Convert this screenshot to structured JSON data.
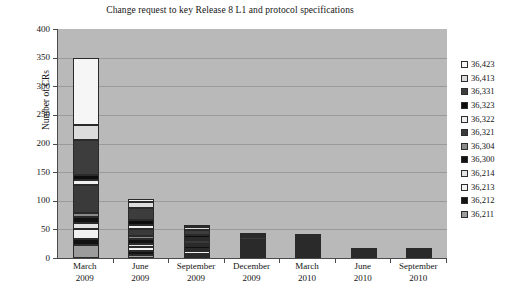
{
  "chart_data": {
    "type": "bar",
    "subtype": "stacked-bar",
    "title": "Change request to key Release 8  L1 and protocol specifications",
    "xlabel": "",
    "ylabel": "Number of CRs",
    "ylim": [
      0,
      400
    ],
    "ytick_step": 50,
    "ytick_labels": [
      "400",
      "350",
      "300",
      "250",
      "200",
      "150",
      "100",
      "50",
      "0"
    ],
    "grid": true,
    "legend_position": "right",
    "categories": [
      "March\n2009",
      "June\n2009",
      "September\n2009",
      "December\n2009",
      "March\n2010",
      "June\n2010",
      "September\n2010"
    ],
    "category_lines": [
      [
        "March",
        "2009"
      ],
      [
        "June",
        "2009"
      ],
      [
        "September",
        "2009"
      ],
      [
        "December",
        "2009"
      ],
      [
        "March",
        "2010"
      ],
      [
        "June",
        "2010"
      ],
      [
        "September",
        "2010"
      ]
    ],
    "totals": [
      350,
      103,
      55,
      30,
      16,
      5,
      5
    ],
    "series": [
      {
        "name": "36,211",
        "color": "#9c9c9c",
        "values": [
          22,
          6,
          3,
          2,
          1,
          0,
          0
        ]
      },
      {
        "name": "36,212",
        "color": "#121212",
        "values": [
          12,
          6,
          4,
          2,
          1,
          1,
          1
        ]
      },
      {
        "name": "36,213",
        "color": "#f2f2f2",
        "values": [
          17,
          7,
          5,
          2,
          1,
          0,
          0
        ]
      },
      {
        "name": "36,214",
        "color": "#e4e4e4",
        "values": [
          10,
          6,
          4,
          2,
          1,
          0,
          0
        ]
      },
      {
        "name": "36,300",
        "color": "#111111",
        "values": [
          10,
          9,
          5,
          3,
          2,
          1,
          1
        ]
      },
      {
        "name": "36,304",
        "color": "#8a8a8a",
        "values": [
          8,
          5,
          3,
          2,
          1,
          0,
          0
        ]
      },
      {
        "name": "36,321",
        "color": "#3a3a3a",
        "values": [
          48,
          12,
          6,
          3,
          2,
          1,
          1
        ]
      },
      {
        "name": "36,322",
        "color": "#efefef",
        "values": [
          10,
          6,
          4,
          2,
          1,
          0,
          0
        ]
      },
      {
        "name": "36,323",
        "color": "#0d0d0d",
        "values": [
          8,
          9,
          5,
          3,
          2,
          1,
          1
        ]
      },
      {
        "name": "36,331",
        "color": "#3d3d3d",
        "values": [
          62,
          22,
          9,
          5,
          2,
          1,
          1
        ]
      },
      {
        "name": "36,413",
        "color": "#dcdcdc",
        "values": [
          25,
          10,
          5,
          3,
          1,
          0,
          0
        ]
      },
      {
        "name": "36,423",
        "color": "#f6f6f6",
        "values": [
          118,
          5,
          2,
          1,
          1,
          0,
          0
        ]
      }
    ],
    "legend_entries": [
      {
        "label": "36,423",
        "color": "#f6f6f6"
      },
      {
        "label": "36,413",
        "color": "#dcdcdc"
      },
      {
        "label": "36,331",
        "color": "#3d3d3d"
      },
      {
        "label": "36,323",
        "color": "#0d0d0d"
      },
      {
        "label": "36,322",
        "color": "#efefef"
      },
      {
        "label": "36,321",
        "color": "#3a3a3a"
      },
      {
        "label": "36,304",
        "color": "#8a8a8a"
      },
      {
        "label": "36,300",
        "color": "#111111"
      },
      {
        "label": "36,214",
        "color": "#e4e4e4"
      },
      {
        "label": "36,213",
        "color": "#f2f2f2"
      },
      {
        "label": "36,212",
        "color": "#121212"
      },
      {
        "label": "36,211",
        "color": "#9c9c9c"
      }
    ],
    "plot_background": "#b9b9b9",
    "axis_color": "#4a4a4a",
    "gridline_color": "#9a9a9a"
  }
}
